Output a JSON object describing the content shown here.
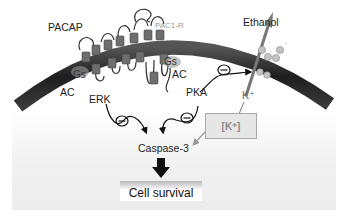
{
  "labels": {
    "pacap": "PACAP",
    "pac1r": "PAC1-R",
    "ethanol": "Ethanol",
    "gs_left": "Gs",
    "gs_right": "Gs",
    "ac_left": "AC",
    "ac_right": "AC",
    "erk": "ERK",
    "pka": "PKA",
    "k_ion": "K⁺",
    "k_concentration": "[K⁺]",
    "caspase": "Caspase-3",
    "outcome": "Cell survival"
  },
  "inhibition_symbol": "⊖",
  "colors": {
    "membrane": "#2a2a2a",
    "receptor_segment": "#6e6e6e",
    "channel_subunit": "#bdbdbd",
    "text": "#222222",
    "receptor_label": "#9a9a9a",
    "k_box_fill": "#e6e6e6",
    "k_box_border": "#a8a8a8"
  },
  "diagram": {
    "nodes": [
      "PACAP",
      "PAC1-R",
      "Gs",
      "AC",
      "ERK",
      "PKA",
      "Ethanol",
      "K+ channel",
      "[K+]",
      "Caspase-3",
      "Cell survival"
    ],
    "edges": [
      {
        "from": "ERK",
        "to": "Caspase-3",
        "type": "inhibition"
      },
      {
        "from": "PKA",
        "to": "Caspase-3",
        "type": "activation"
      },
      {
        "from": "PKA",
        "to": "K+ channel",
        "type": "inhibition"
      },
      {
        "from": "K+ channel",
        "to": "[K+]",
        "type": "efflux"
      },
      {
        "from": "[K+]",
        "to": "Caspase-3",
        "type": "activation"
      },
      {
        "from": "Caspase-3",
        "to": "Cell survival",
        "type": "outcome"
      }
    ]
  }
}
